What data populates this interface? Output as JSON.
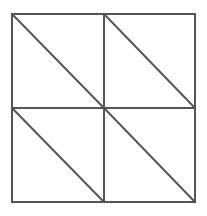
{
  "figure": {
    "background_color": "#ffffff",
    "stroke_color": "#555555",
    "diagonal_color": "#555555",
    "stroke_width": 2,
    "diagonal_width": 2,
    "canvas": {
      "width": 207,
      "height": 216
    },
    "outer_square": {
      "left": 12,
      "top": 14,
      "right": 195,
      "bottom": 202,
      "width": 183,
      "height": 188
    },
    "midlines": {
      "vertical_x": 104,
      "horizontal_y": 108
    },
    "center_point": {
      "x": 104,
      "y": 108
    },
    "counts": {
      "quadrants": 4,
      "diagonals": 4,
      "triangles": 8,
      "midlines": 2
    },
    "outer_border": {
      "name": "outer-square-border",
      "points": "12,14 195,14 195,202 12,202"
    },
    "grid_lines": [
      {
        "name": "vertical-midline",
        "x1": 104,
        "y1": 14,
        "x2": 104,
        "y2": 202
      },
      {
        "name": "horizontal-midline",
        "x1": 12,
        "y1": 108,
        "x2": 195,
        "y2": 108
      }
    ],
    "quadrant_diagonals": [
      {
        "name": "diagonal-top-left",
        "quadrant": "top-left",
        "direction": "backslash",
        "x1": 12,
        "y1": 14,
        "x2": 104,
        "y2": 108
      },
      {
        "name": "diagonal-top-right",
        "quadrant": "top-right",
        "direction": "backslash",
        "x1": 104,
        "y1": 14,
        "x2": 195,
        "y2": 108
      },
      {
        "name": "diagonal-bottom-left",
        "quadrant": "bottom-left",
        "direction": "backslash",
        "x1": 12,
        "y1": 108,
        "x2": 104,
        "y2": 202
      },
      {
        "name": "diagonal-bottom-right",
        "quadrant": "bottom-right",
        "direction": "backslash",
        "x1": 104,
        "y1": 108,
        "x2": 195,
        "y2": 202
      }
    ]
  }
}
